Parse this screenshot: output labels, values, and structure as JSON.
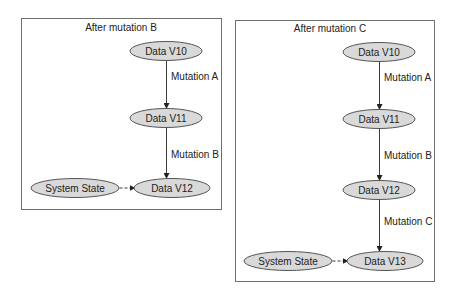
{
  "diagrams": [
    {
      "title": "After mutation B",
      "frame": {
        "x": 21,
        "y": 18,
        "w": 200,
        "h": 191
      },
      "title_pos": {
        "x": 121,
        "y": 31
      },
      "nodes": [
        {
          "id": "v10",
          "label": "Data V10",
          "cx": 166,
          "cy": 51,
          "rx": 36,
          "ry": 9.5
        },
        {
          "id": "v11",
          "label": "Data V11",
          "cx": 166,
          "cy": 118,
          "rx": 36,
          "ry": 9.5
        },
        {
          "id": "v12",
          "label": "Data V12",
          "cx": 172,
          "cy": 188,
          "rx": 38,
          "ry": 9.5
        },
        {
          "id": "sys",
          "label": "System State",
          "cx": 75,
          "cy": 188,
          "rx": 44,
          "ry": 9.5
        }
      ],
      "edges": [
        {
          "from": "v10",
          "to": "v11",
          "label": "Mutation A",
          "style": "solid",
          "x1": 166,
          "y1": 61,
          "x2": 166,
          "y2": 108,
          "lx": 171,
          "ly": 80
        },
        {
          "from": "v11",
          "to": "v12",
          "label": "Mutation B",
          "style": "solid",
          "x1": 166,
          "y1": 128,
          "x2": 166,
          "y2": 178,
          "lx": 171,
          "ly": 158
        },
        {
          "from": "sys",
          "to": "v12",
          "label": "",
          "style": "dashed",
          "x1": 119,
          "y1": 188,
          "x2": 134,
          "y2": 188,
          "lx": 0,
          "ly": 0
        }
      ]
    },
    {
      "title": "After mutation C",
      "frame": {
        "x": 235,
        "y": 20,
        "w": 199,
        "h": 261
      },
      "title_pos": {
        "x": 330,
        "y": 32
      },
      "nodes": [
        {
          "id": "v10",
          "label": "Data V10",
          "cx": 379,
          "cy": 52,
          "rx": 36,
          "ry": 9.5
        },
        {
          "id": "v11",
          "label": "Data V11",
          "cx": 379,
          "cy": 119,
          "rx": 36,
          "ry": 9.5
        },
        {
          "id": "v12",
          "label": "Data V12",
          "cx": 379,
          "cy": 190,
          "rx": 36,
          "ry": 9.5
        },
        {
          "id": "v13",
          "label": "Data V13",
          "cx": 385,
          "cy": 261,
          "rx": 38,
          "ry": 9.5
        },
        {
          "id": "sys",
          "label": "System State",
          "cx": 288,
          "cy": 261,
          "rx": 44,
          "ry": 9.5
        }
      ],
      "edges": [
        {
          "from": "v10",
          "to": "v11",
          "label": "Mutation A",
          "style": "solid",
          "x1": 379,
          "y1": 62,
          "x2": 379,
          "y2": 109,
          "lx": 384,
          "ly": 81
        },
        {
          "from": "v11",
          "to": "v12",
          "label": "Mutation B",
          "style": "solid",
          "x1": 379,
          "y1": 129,
          "x2": 379,
          "y2": 180,
          "lx": 384,
          "ly": 159
        },
        {
          "from": "v12",
          "to": "v13",
          "label": "Mutation C",
          "style": "solid",
          "x1": 379,
          "y1": 200,
          "x2": 379,
          "y2": 251,
          "lx": 384,
          "ly": 225
        },
        {
          "from": "sys",
          "to": "v13",
          "label": "",
          "style": "dashed",
          "x1": 332,
          "y1": 261,
          "x2": 347,
          "y2": 261,
          "lx": 0,
          "ly": 0
        }
      ]
    }
  ]
}
